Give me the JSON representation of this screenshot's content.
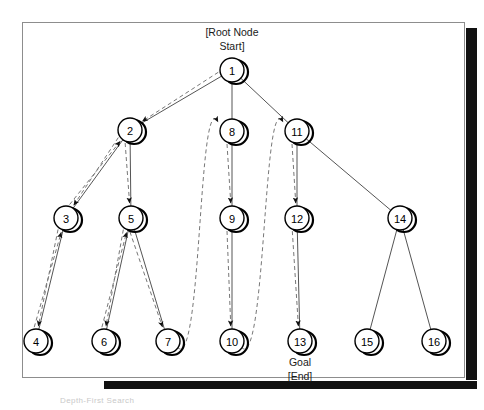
{
  "figure": {
    "title_above_root": "[Root Node\nStart]",
    "root_annotation_line1": "[Root Node",
    "root_annotation_line2": "Start]",
    "goal_annotation_line1": "Goal",
    "goal_annotation_line2": "[End]",
    "caption": "Depth-First Search",
    "colors": {
      "node_stroke": "#000000",
      "node_fill": "#ffffff",
      "tree_edge": "#555555",
      "traversal_edge": "#777777",
      "frame_border": "#8d8d8d",
      "shadow": "#111111",
      "background": "#ffffff"
    }
  },
  "graph": {
    "type": "tree-search-traversal",
    "node_radius": 12,
    "nodes": [
      {
        "id": "1",
        "label": "1",
        "cx": 232,
        "cy": 70,
        "annotation": "root"
      },
      {
        "id": "2",
        "label": "2",
        "cx": 130,
        "cy": 130,
        "annotation": ""
      },
      {
        "id": "3",
        "label": "3",
        "cx": 66,
        "cy": 218,
        "annotation": ""
      },
      {
        "id": "4",
        "label": "4",
        "cx": 36,
        "cy": 341,
        "annotation": ""
      },
      {
        "id": "5",
        "label": "5",
        "cx": 131,
        "cy": 218,
        "annotation": ""
      },
      {
        "id": "6",
        "label": "6",
        "cx": 104,
        "cy": 341,
        "annotation": ""
      },
      {
        "id": "7",
        "label": "7",
        "cx": 168,
        "cy": 341,
        "annotation": ""
      },
      {
        "id": "8",
        "label": "8",
        "cx": 232,
        "cy": 131,
        "annotation": ""
      },
      {
        "id": "9",
        "label": "9",
        "cx": 232,
        "cy": 218,
        "annotation": ""
      },
      {
        "id": "10",
        "label": "10",
        "cx": 232,
        "cy": 341,
        "annotation": ""
      },
      {
        "id": "11",
        "label": "11",
        "cx": 297,
        "cy": 131,
        "annotation": ""
      },
      {
        "id": "12",
        "label": "12",
        "cx": 297,
        "cy": 218,
        "annotation": ""
      },
      {
        "id": "13",
        "label": "13",
        "cx": 300,
        "cy": 341,
        "annotation": "goal"
      },
      {
        "id": "14",
        "label": "14",
        "cx": 400,
        "cy": 218,
        "annotation": ""
      },
      {
        "id": "15",
        "label": "15",
        "cx": 367,
        "cy": 341,
        "annotation": ""
      },
      {
        "id": "16",
        "label": "16",
        "cx": 434,
        "cy": 341,
        "annotation": ""
      }
    ],
    "tree_edges": [
      {
        "from": "1",
        "to": "2"
      },
      {
        "from": "1",
        "to": "8"
      },
      {
        "from": "1",
        "to": "11"
      },
      {
        "from": "2",
        "to": "3"
      },
      {
        "from": "2",
        "to": "5"
      },
      {
        "from": "3",
        "to": "4"
      },
      {
        "from": "5",
        "to": "6"
      },
      {
        "from": "5",
        "to": "7"
      },
      {
        "from": "8",
        "to": "9"
      },
      {
        "from": "9",
        "to": "10"
      },
      {
        "from": "11",
        "to": "12"
      },
      {
        "from": "12",
        "to": "13"
      },
      {
        "from": "11",
        "to": "14"
      },
      {
        "from": "14",
        "to": "15"
      },
      {
        "from": "14",
        "to": "16"
      }
    ],
    "traversal_order": [
      "1",
      "2",
      "3",
      "4",
      "3",
      "2",
      "5",
      "6",
      "5",
      "7",
      "5",
      "2",
      "1",
      "8",
      "9",
      "10",
      "9",
      "8",
      "1",
      "11",
      "12",
      "13"
    ],
    "traversal_arrows": [
      {
        "from": "1",
        "to": "2",
        "kind": "descend"
      },
      {
        "from": "2",
        "to": "3",
        "kind": "descend"
      },
      {
        "from": "3",
        "to": "4",
        "kind": "descend"
      },
      {
        "from": "4",
        "to": "3",
        "kind": "backtrack"
      },
      {
        "from": "3",
        "to": "2",
        "kind": "backtrack"
      },
      {
        "from": "2",
        "to": "5",
        "kind": "descend"
      },
      {
        "from": "5",
        "to": "6",
        "kind": "descend"
      },
      {
        "from": "6",
        "to": "5",
        "kind": "backtrack"
      },
      {
        "from": "5",
        "to": "7",
        "kind": "descend"
      },
      {
        "from": "7",
        "to": "8",
        "kind": "backtrack-jump"
      },
      {
        "from": "8",
        "to": "9",
        "kind": "descend"
      },
      {
        "from": "9",
        "to": "10",
        "kind": "descend"
      },
      {
        "from": "10",
        "to": "11",
        "kind": "backtrack-jump"
      },
      {
        "from": "11",
        "to": "12",
        "kind": "descend"
      },
      {
        "from": "12",
        "to": "13",
        "kind": "descend"
      }
    ]
  }
}
